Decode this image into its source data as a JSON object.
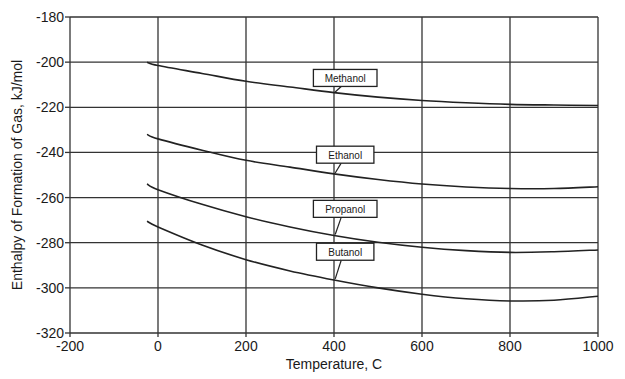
{
  "chart_data": {
    "type": "line",
    "title": "",
    "xlabel": "Temperature, C",
    "ylabel": "Enthalpy of Formation of Gas, kJ/mol",
    "xlim": [
      -200,
      1000
    ],
    "ylim": [
      -320,
      -180
    ],
    "xticks": [
      -200,
      0,
      200,
      400,
      600,
      800,
      1000
    ],
    "yticks": [
      -180,
      -200,
      -220,
      -240,
      -260,
      -280,
      -300,
      -320
    ],
    "grid": true,
    "legend": "inline-labels",
    "x": [
      -25,
      0,
      100,
      200,
      300,
      400,
      500,
      600,
      700,
      800,
      900,
      1000
    ],
    "series": [
      {
        "name": "Methanol",
        "label_at": [
          430,
          -207
        ],
        "values": [
          -200,
          -201.5,
          -205,
          -208.5,
          -211,
          -213.5,
          -215.5,
          -217,
          -218,
          -218.7,
          -219,
          -219.2
        ]
      },
      {
        "name": "Ethanol",
        "label_at": [
          430,
          -241
        ],
        "values": [
          -232,
          -234,
          -239,
          -243.5,
          -246.5,
          -249.5,
          -252,
          -254,
          -255.3,
          -256,
          -256,
          -255.2
        ]
      },
      {
        "name": "Propanol",
        "label_at": [
          430,
          -265
        ],
        "values": [
          -254,
          -256.5,
          -263,
          -268.5,
          -273,
          -276.8,
          -279.8,
          -282,
          -283.5,
          -284.3,
          -284,
          -283.2
        ]
      },
      {
        "name": "Butanol",
        "label_at": [
          430,
          -284
        ],
        "values": [
          -270.5,
          -273,
          -281,
          -287.5,
          -292.5,
          -296.5,
          -300,
          -302.8,
          -304.8,
          -305.8,
          -305.5,
          -303.7
        ]
      }
    ]
  },
  "page": {
    "xlabel": "Temperature, C",
    "ylabel": "Enthalpy of Formation of Gas, kJ/mol"
  }
}
